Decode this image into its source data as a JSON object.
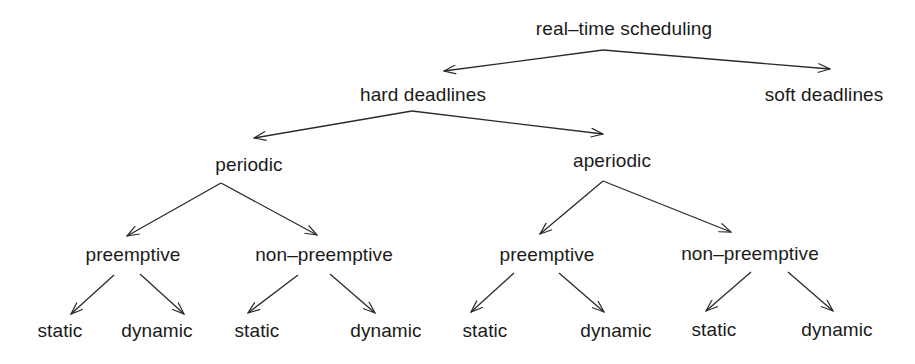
{
  "diagram": {
    "type": "tree",
    "stroke_color": "#2a2a2a",
    "text_color": "#1a1a1a",
    "background": "#ffffff",
    "nodes": {
      "root": "real–time scheduling",
      "hard": "hard deadlines",
      "soft": "soft deadlines",
      "periodic": "periodic",
      "aperiodic": "aperiodic",
      "p_pre": "preemptive",
      "p_nonpre": "non–preemptive",
      "a_pre": "preemptive",
      "a_nonpre": "non–preemptive",
      "p_pre_static": "static",
      "p_pre_dynamic": "dynamic",
      "p_nonpre_static": "static",
      "p_nonpre_dynamic": "dynamic",
      "a_pre_static": "static",
      "a_pre_dynamic": "dynamic",
      "a_nonpre_static": "static",
      "a_nonpre_dynamic": "dynamic"
    },
    "edges": [
      {
        "from": "root",
        "to": "hard"
      },
      {
        "from": "root",
        "to": "soft"
      },
      {
        "from": "hard",
        "to": "periodic"
      },
      {
        "from": "hard",
        "to": "aperiodic"
      },
      {
        "from": "periodic",
        "to": "p_pre"
      },
      {
        "from": "periodic",
        "to": "p_nonpre"
      },
      {
        "from": "aperiodic",
        "to": "a_pre"
      },
      {
        "from": "aperiodic",
        "to": "a_nonpre"
      },
      {
        "from": "p_pre",
        "to": "p_pre_static"
      },
      {
        "from": "p_pre",
        "to": "p_pre_dynamic"
      },
      {
        "from": "p_nonpre",
        "to": "p_nonpre_static"
      },
      {
        "from": "p_nonpre",
        "to": "p_nonpre_dynamic"
      },
      {
        "from": "a_pre",
        "to": "a_pre_static"
      },
      {
        "from": "a_pre",
        "to": "a_pre_dynamic"
      },
      {
        "from": "a_nonpre",
        "to": "a_nonpre_static"
      },
      {
        "from": "a_nonpre",
        "to": "a_nonpre_dynamic"
      }
    ]
  }
}
